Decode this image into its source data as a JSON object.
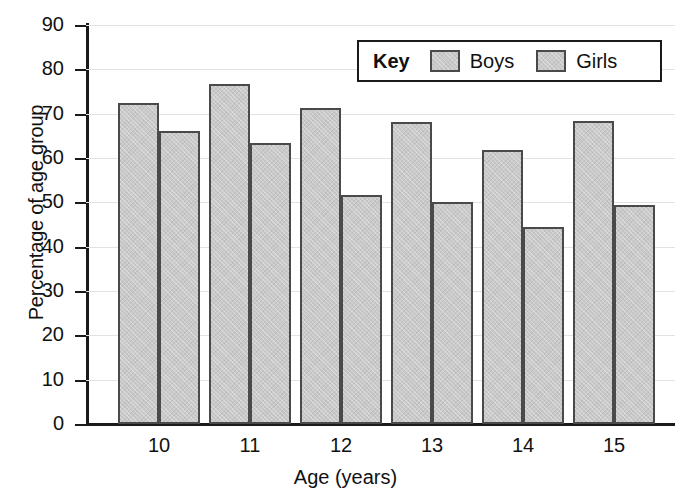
{
  "chart_data": {
    "type": "bar",
    "title": "",
    "xlabel": "Age (years)",
    "ylabel": "Percentage of age group",
    "categories": [
      "10",
      "11",
      "12",
      "13",
      "14",
      "15"
    ],
    "series": [
      {
        "name": "Boys",
        "values": [
          72.5,
          76.8,
          71.2,
          68.2,
          61.7,
          68.3
        ]
      },
      {
        "name": "Girls",
        "values": [
          66.0,
          63.3,
          51.6,
          50.0,
          44.5,
          49.5
        ]
      }
    ],
    "ylim": [
      0,
      90
    ],
    "ytick_labels": [
      "0",
      "10",
      "20",
      "30",
      "40",
      "50",
      "60",
      "70",
      "80",
      "90"
    ],
    "ytick_values": [
      0,
      10,
      20,
      30,
      40,
      50,
      60,
      70,
      80,
      90
    ],
    "grid": true,
    "legend_position": "top-right",
    "legend_title": "Key",
    "bar_fill_color": "#c9c9c9",
    "bar_border_color": "#4a4a4a",
    "axis_color": "#1a1a1a",
    "gridline_color": "#e2e2e2",
    "background_color": "#ffffff"
  }
}
